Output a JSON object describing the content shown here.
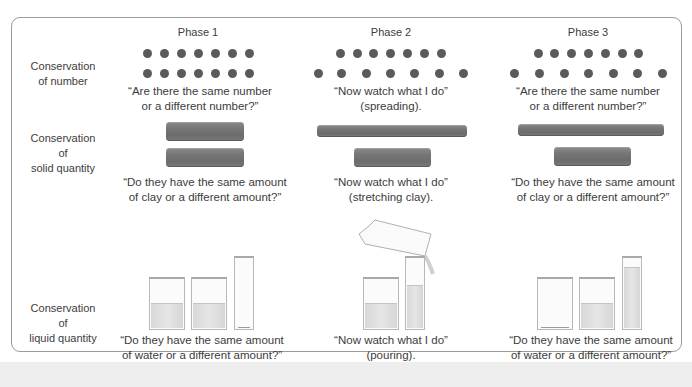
{
  "phases": [
    "Phase 1",
    "Phase 2",
    "Phase 3"
  ],
  "rows": [
    {
      "label": [
        "Conservation",
        "of number"
      ],
      "captions": [
        [
          "“Are there the same number",
          "or a different number?”"
        ],
        [
          "“Now watch what I do”",
          "(spreading)."
        ],
        [
          "“Are there the same number",
          "or a different number?”"
        ]
      ]
    },
    {
      "label": [
        "Conservation",
        "of",
        "solid quantity"
      ],
      "captions": [
        [
          "“Do they have the same amount",
          "of clay or a different amount?”"
        ],
        [
          "“Now watch what I do”",
          "(stretching clay)."
        ],
        [
          "“Do they have the same amount",
          "of clay or a different amount?”"
        ]
      ]
    },
    {
      "label": [
        "Conservation",
        "of",
        "liquid quantity"
      ],
      "captions": [
        [
          "“Do they have the same amount",
          "of water or a different amount?”"
        ],
        [
          "“Now watch what I do”",
          "(pouring)."
        ],
        [
          "“Do they have the same amount",
          "of water or a different amount?”"
        ]
      ]
    }
  ],
  "illustrations": {
    "number": {
      "dot_color": "#5a5a5a",
      "counts_per_row": 7,
      "phase1": {
        "row1_spacing": "compact",
        "row2_spacing": "compact"
      },
      "phase2": {
        "row1_spacing": "compact",
        "row2_spacing": "spread"
      },
      "phase3": {
        "row1_spacing": "compact",
        "row2_spacing": "spread"
      }
    },
    "solid": {
      "clay_color": "#767676",
      "phase1": [
        "short",
        "short"
      ],
      "phase2": [
        "long",
        "short"
      ],
      "phase3": [
        "long",
        "short"
      ]
    },
    "liquid": {
      "water_color": "#dcdcdc",
      "phase1": [
        "beaker half full",
        "beaker half full",
        "tall cylinder empty"
      ],
      "phase2": [
        "beaker half full",
        "tall cylinder being filled from tilted beaker"
      ],
      "phase3": [
        "beaker empty",
        "beaker half full",
        "tall cylinder mostly full"
      ]
    }
  }
}
